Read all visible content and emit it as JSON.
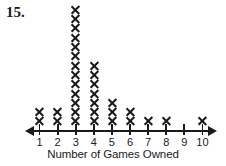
{
  "question": {
    "number_label": "15."
  },
  "axis": {
    "title": "Number of Games Owned",
    "tick_labels": [
      "1",
      "2",
      "3",
      "4",
      "5",
      "6",
      "7",
      "8",
      "9",
      "10"
    ],
    "left_arrow_icon": "arrow-left-icon",
    "right_arrow_icon": "arrow-right-icon"
  },
  "marks": {
    "glyph": "x-mark-icon",
    "color": "#1a1a1a"
  },
  "chart_data": {
    "type": "bar",
    "plot_style": "dot-plot-x-marks",
    "title": "",
    "xlabel": "Number of Games Owned",
    "ylabel": "",
    "categories": [
      "1",
      "2",
      "3",
      "4",
      "5",
      "6",
      "7",
      "8",
      "9",
      "10"
    ],
    "values": [
      2,
      2,
      13,
      7,
      3,
      2,
      1,
      1,
      0,
      1
    ],
    "xlim": [
      1,
      10
    ],
    "ylim": [
      0,
      13
    ],
    "grid": false,
    "legend": "none",
    "total_count": 32,
    "annotations": [
      "15."
    ]
  }
}
